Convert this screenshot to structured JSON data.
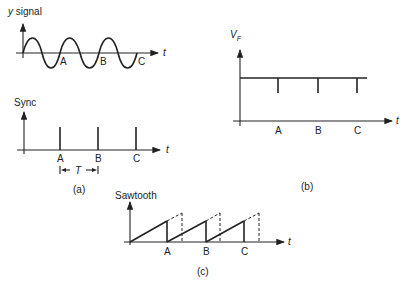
{
  "panel_a": {
    "signal_label": "y signal",
    "signal_label_italic_part": "y",
    "signal_label_rest": " signal",
    "sync_label": "Sync",
    "time_axis": "t",
    "marks": [
      "A",
      "B",
      "C"
    ],
    "period_label": "T",
    "caption": "(a)"
  },
  "panel_b": {
    "ylabel": "V",
    "ylabel_sub": "F",
    "time_axis": "t",
    "marks": [
      "A",
      "B",
      "C"
    ],
    "caption": "(b)"
  },
  "panel_c": {
    "ylabel": "Sawtooth",
    "time_axis": "t",
    "marks": [
      "A",
      "B",
      "C"
    ],
    "caption": "(c)"
  }
}
